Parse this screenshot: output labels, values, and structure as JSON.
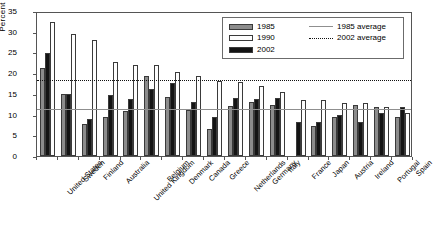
{
  "chart_data": {
    "type": "bar",
    "title": "",
    "xlabel": "",
    "ylabel": "Percent",
    "ylim": [
      0,
      35
    ],
    "ytick_values": [
      0,
      5,
      10,
      15,
      20,
      25,
      30,
      35
    ],
    "ytick_labels": [
      "0",
      "5",
      "10",
      "15",
      "20",
      "25",
      "30",
      "35"
    ],
    "grid": false,
    "legend_position": "top-right",
    "bar_draw_order": [
      "1985",
      "2002",
      "1990"
    ],
    "categories": [
      "United States",
      "Sweden",
      "Finland",
      "Australia",
      "United Kingdom",
      "Belgium",
      "Denmark",
      "Canada",
      "Greece",
      "Netherlands",
      "Germany",
      "Italy",
      "France",
      "Japan",
      "Austria",
      "Ireland",
      "Portugal",
      "Spain"
    ],
    "series": [
      {
        "name": "1985",
        "color": "#8c8c8c",
        "values": [
          21.3,
          15.0,
          7.8,
          9.3,
          10.9,
          19.3,
          14.2,
          11.0,
          6.5,
          12.1,
          13.1,
          12.3,
          null,
          7.2,
          9.3,
          12.2,
          11.8,
          9.4
        ]
      },
      {
        "name": "2002",
        "color": "#141414",
        "values": [
          24.8,
          15.0,
          9.0,
          14.7,
          13.8,
          16.1,
          17.7,
          13.1,
          9.3,
          13.9,
          13.8,
          14.1,
          8.3,
          8.1,
          9.8,
          8.2,
          10.3,
          11.9
        ]
      },
      {
        "name": "1990",
        "color": "#fdfdfd",
        "values": [
          32.4,
          29.5,
          28.1,
          22.7,
          21.9,
          21.9,
          20.3,
          19.3,
          18.1,
          17.9,
          16.9,
          15.4,
          13.6,
          13.5,
          12.9,
          12.7,
          11.9,
          10.5
        ]
      }
    ],
    "reference_lines": [
      {
        "name": "1985 average",
        "value": 11.8,
        "style": "solid",
        "color": "#8f8f8f"
      },
      {
        "name": "2002 average",
        "value": 18.9,
        "style": "dotted",
        "color": "#111111"
      }
    ],
    "legend_entries": [
      {
        "label": "1985",
        "type": "swatch",
        "key": "y1985"
      },
      {
        "label": "1990",
        "type": "swatch",
        "key": "y1990"
      },
      {
        "label": "2002",
        "type": "swatch",
        "key": "y2002"
      },
      {
        "label": "1985 average",
        "type": "line",
        "key": "solid"
      },
      {
        "label": "2002 average",
        "type": "line",
        "key": "dotted"
      }
    ]
  }
}
